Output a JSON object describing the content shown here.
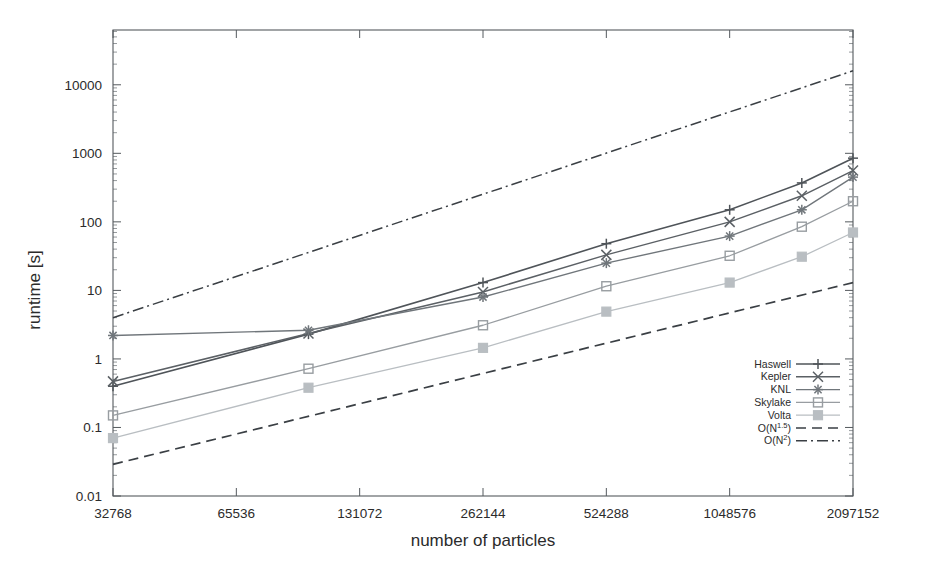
{
  "chart_data": {
    "type": "line",
    "title": "",
    "xlabel": "number of particles",
    "ylabel": "runtime [s]",
    "xscale": "log2",
    "yscale": "log10",
    "xlim": [
      32768,
      2097152
    ],
    "ylim": [
      0.01,
      63000
    ],
    "grid": false,
    "legend_position": "bottom-right",
    "xticks": [
      32768,
      65536,
      131072,
      262144,
      524288,
      1048576,
      2097152
    ],
    "xtick_labels": [
      "32768",
      "65536",
      "131072",
      "262144",
      "524288",
      "1048576",
      "2097152"
    ],
    "yticks": [
      0.01,
      0.1,
      1,
      10,
      100,
      1000,
      10000
    ],
    "ytick_labels": [
      "0.01",
      "0.1",
      "1",
      "10",
      "100",
      "1000",
      "10000"
    ],
    "x": [
      32768,
      98304,
      262144,
      524288,
      1048576,
      1572864,
      2097152
    ],
    "series": [
      {
        "name": "Haswell",
        "marker": "plus",
        "color": "#4f5459",
        "dash": "none",
        "width": 1.6,
        "x": [
          32768,
          98304,
          262144,
          524288,
          1048576,
          1572864,
          2097152
        ],
        "values": [
          0.4,
          2.3,
          13.0,
          48.0,
          150.0,
          370.0,
          850.0
        ]
      },
      {
        "name": "Kepler",
        "marker": "cross",
        "color": "#5b6065",
        "dash": "none",
        "width": 1.5,
        "x": [
          32768,
          98304,
          262144,
          524288,
          1048576,
          1572864,
          2097152
        ],
        "values": [
          0.47,
          2.35,
          9.5,
          33.0,
          100.0,
          240.0,
          560.0
        ]
      },
      {
        "name": "KNL",
        "marker": "star",
        "color": "#70767b",
        "dash": "none",
        "width": 1.4,
        "x": [
          32768,
          98304,
          262144,
          524288,
          1048576,
          1572864,
          2097152
        ],
        "values": [
          2.2,
          2.62,
          8.0,
          25.0,
          62.0,
          150.0,
          450.0
        ]
      },
      {
        "name": "Skylake",
        "marker": "square-open",
        "color": "#989da1",
        "dash": "none",
        "width": 1.3,
        "x": [
          32768,
          98304,
          262144,
          524288,
          1048576,
          1572864,
          2097152
        ],
        "values": [
          0.15,
          0.72,
          3.1,
          11.5,
          32.0,
          85.0,
          200.0
        ]
      },
      {
        "name": "Volta",
        "marker": "square-filled",
        "color": "#b9bec2",
        "dash": "none",
        "width": 1.3,
        "x": [
          32768,
          98304,
          262144,
          524288,
          1048576,
          1572864,
          2097152
        ],
        "values": [
          0.07,
          0.38,
          1.45,
          4.9,
          13.0,
          31.0,
          70.0
        ]
      },
      {
        "name": "O(N^1.5)",
        "label": "O(N",
        "exponent": "1.5",
        "suffix": ")",
        "marker": "none",
        "color": "#3a3f44",
        "dash": "10,6",
        "width": 1.7,
        "x": [
          32768,
          2097152
        ],
        "values": [
          0.029,
          13.0
        ]
      },
      {
        "name": "O(N^2)",
        "label": "O(N",
        "exponent": "2",
        "suffix": ")",
        "marker": "none",
        "color": "#3a3f44",
        "dash": "11,4,2,4",
        "width": 1.5,
        "x": [
          32768,
          2097152
        ],
        "values": [
          4.0,
          16000.0
        ]
      }
    ]
  },
  "legend": {
    "entries": [
      {
        "label": "Haswell"
      },
      {
        "label": "Kepler"
      },
      {
        "label": "KNL"
      },
      {
        "label": "Skylake"
      },
      {
        "label": "Volta"
      },
      {
        "label": "O(N",
        "exponent": "1.5",
        "suffix": ")"
      },
      {
        "label": "O(N",
        "exponent": "2",
        "suffix": ")"
      }
    ]
  }
}
